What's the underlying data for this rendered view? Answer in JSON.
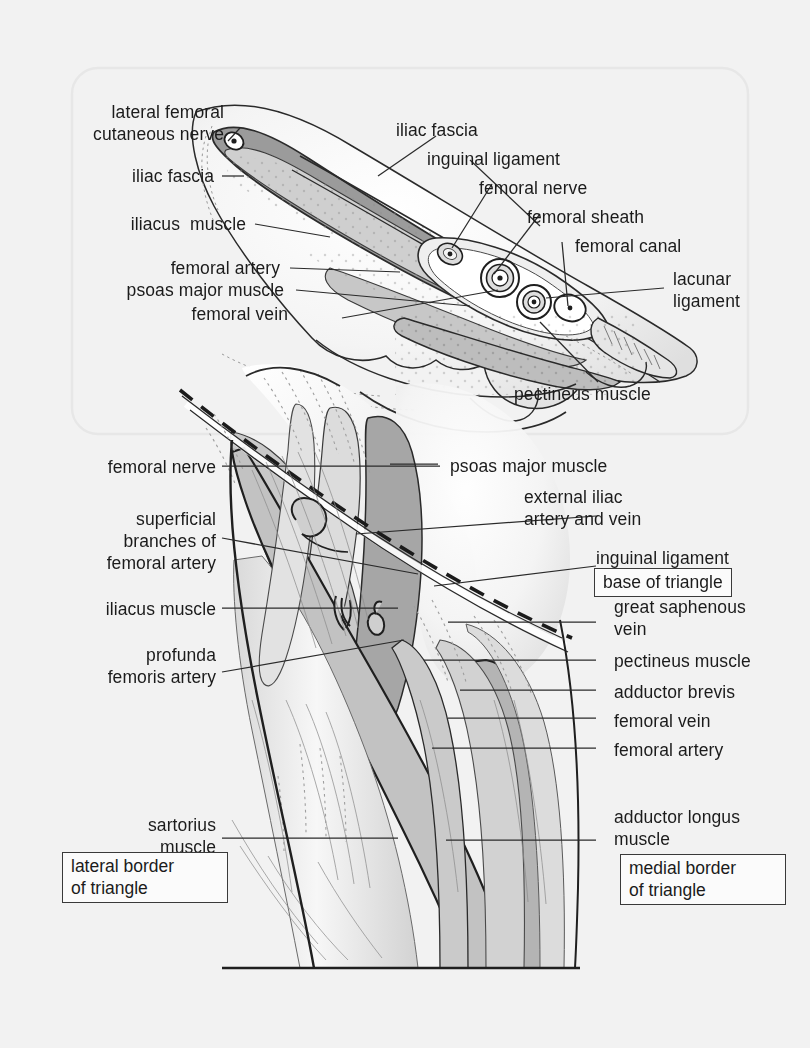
{
  "figure": {
    "kind": "anatomical-illustration",
    "background_color": "#f2f2f2",
    "ink_color": "#1b1b1b",
    "panels": [
      {
        "id": "top",
        "description": "Cross-section through inguinal ligament showing femoral sheath contents"
      },
      {
        "id": "bottom",
        "description": "Anterior view of femoral triangle with borders marked"
      }
    ]
  },
  "top_panel": {
    "labels": {
      "lateral_femoral_cutaneous_nerve": "lateral femoral\ncutaneous nerve",
      "iliac_fascia_left": "iliac fascia",
      "iliacus_muscle": "iliacus  muscle",
      "femoral_artery": "femoral artery",
      "psoas_major_muscle": "psoas major muscle",
      "femoral_vein": "femoral vein",
      "iliac_fascia_right": "iliac fascia",
      "inguinal_ligament": "inguinal ligament",
      "femoral_nerve": "femoral nerve",
      "femoral_sheath": "femoral sheath",
      "femoral_canal": "femoral canal",
      "lacunar_ligament": "lacunar\nligament",
      "pectineus_muscle": "pectineus muscle"
    }
  },
  "bottom_panel": {
    "labels": {
      "femoral_nerve": "femoral nerve",
      "superficial_branches_of_femoral_artery": "superficial\nbranches of\nfemoral artery",
      "iliacus_muscle": "iliacus muscle",
      "profunda_femoris_artery": "profunda\nfemoris artery",
      "sartorius_muscle": "sartorius\nmuscle",
      "psoas_major_muscle": "psoas major muscle",
      "external_iliac_artery_and_vein": "external iliac\nartery and vein",
      "inguinal_ligament": "inguinal ligament",
      "great_saphenous_vein": "great saphenous\nvein",
      "pectineus_muscle": "pectineus muscle",
      "adductor_brevis": "adductor brevis",
      "femoral_vein": "femoral vein",
      "femoral_artery": "femoral artery",
      "adductor_longus_muscle": "adductor longus\nmuscle"
    },
    "boxed_labels": {
      "base_of_triangle": "base of triangle",
      "lateral_border_of_triangle": "lateral border\nof triangle",
      "medial_border_of_triangle": "medial border\nof triangle"
    }
  },
  "palette": {
    "paper": "#f2f2f2",
    "panel_outline": "#e4e4e4",
    "line": "#1b1b1b",
    "leader": "#2a2a2a",
    "fascia_dark": "#9a9a9a",
    "muscle_mid": "#c3c3c3",
    "muscle_light": "#d6d6d6",
    "muscle_pale": "#e2e2e2",
    "vessel_dark": "#a8a8a8",
    "white": "#ffffff"
  }
}
